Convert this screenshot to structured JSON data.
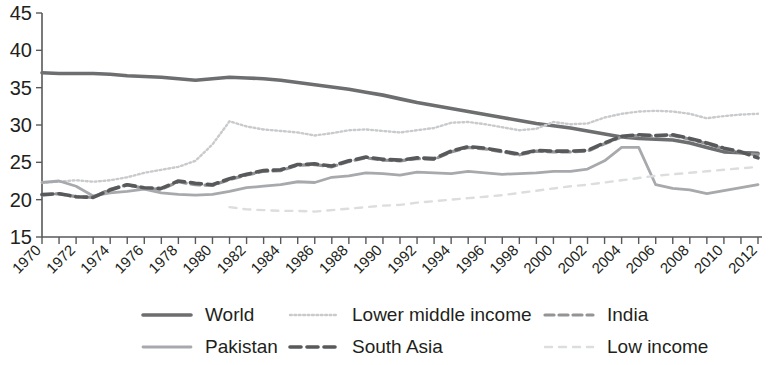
{
  "chart_data": {
    "type": "line",
    "title": "",
    "xlabel": "",
    "ylabel": "",
    "ylim": [
      15,
      45
    ],
    "yticks": [
      15,
      20,
      25,
      30,
      35,
      40,
      45
    ],
    "xlim": [
      1970,
      2012
    ],
    "grid": false,
    "legend_position": "bottom",
    "x": [
      1970,
      1971,
      1972,
      1973,
      1974,
      1975,
      1976,
      1977,
      1978,
      1979,
      1980,
      1981,
      1982,
      1983,
      1984,
      1985,
      1986,
      1987,
      1988,
      1989,
      1990,
      1991,
      1992,
      1993,
      1994,
      1995,
      1996,
      1997,
      1998,
      1999,
      2000,
      2001,
      2002,
      2003,
      2004,
      2005,
      2006,
      2007,
      2008,
      2009,
      2010,
      2011,
      2012
    ],
    "xtick_labels": [
      "1970",
      "1972",
      "1974",
      "1976",
      "1978",
      "1980",
      "1982",
      "1984",
      "1986",
      "1988",
      "1990",
      "1992",
      "1994",
      "1996",
      "1998",
      "2000",
      "2002",
      "2004",
      "2006",
      "2008",
      "2010",
      "2012"
    ],
    "series": [
      {
        "name": "World",
        "color": "#6d6e70",
        "style": "solid",
        "width": 3.6,
        "values": [
          37.0,
          36.9,
          36.9,
          36.9,
          36.8,
          36.6,
          36.5,
          36.4,
          36.2,
          36.0,
          36.2,
          36.4,
          36.3,
          36.2,
          36.0,
          35.7,
          35.4,
          35.1,
          34.8,
          34.4,
          34.0,
          33.5,
          33.0,
          32.6,
          32.2,
          31.8,
          31.4,
          31.0,
          30.6,
          30.2,
          29.9,
          29.6,
          29.2,
          28.8,
          28.4,
          28.2,
          28.1,
          28.0,
          27.6,
          27.0,
          26.4,
          26.3,
          26.2
        ]
      },
      {
        "name": "Lower middle income",
        "color": "#c9cacc",
        "style": "dotted",
        "width": 2.4,
        "values": [
          22.3,
          22.4,
          22.6,
          22.4,
          22.6,
          23.0,
          23.6,
          24.0,
          24.4,
          25.2,
          27.4,
          30.5,
          29.8,
          29.4,
          29.2,
          29.0,
          28.6,
          28.9,
          29.3,
          29.4,
          29.2,
          29.0,
          29.3,
          29.6,
          30.3,
          30.4,
          30.1,
          29.7,
          29.3,
          29.5,
          30.4,
          30.1,
          30.2,
          31.0,
          31.5,
          31.8,
          31.9,
          31.8,
          31.5,
          30.9,
          31.2,
          31.4,
          31.5
        ]
      },
      {
        "name": "India",
        "color": "#929497",
        "style": "dashed",
        "width": 3.2,
        "values": [
          20.6,
          20.8,
          20.4,
          20.3,
          21.4,
          22.0,
          21.5,
          21.4,
          22.4,
          22.0,
          21.9,
          22.7,
          23.3,
          23.8,
          23.9,
          24.6,
          24.7,
          24.4,
          25.1,
          25.6,
          25.3,
          25.2,
          25.5,
          25.4,
          26.4,
          27.0,
          26.8,
          26.4,
          26.0,
          26.5,
          26.4,
          26.4,
          26.5,
          27.5,
          28.4,
          28.6,
          28.5,
          28.6,
          28.1,
          27.5,
          26.8,
          26.3,
          26.0
        ]
      },
      {
        "name": "Pakistan",
        "color": "#a7a9ac",
        "style": "solid",
        "width": 2.8,
        "values": [
          22.3,
          22.5,
          21.8,
          20.5,
          20.9,
          21.1,
          21.4,
          20.9,
          20.7,
          20.6,
          20.7,
          21.1,
          21.6,
          21.8,
          22.0,
          22.4,
          22.3,
          23.0,
          23.2,
          23.6,
          23.5,
          23.3,
          23.7,
          23.6,
          23.5,
          23.8,
          23.6,
          23.4,
          23.5,
          23.6,
          23.8,
          23.8,
          24.1,
          25.2,
          27.0,
          27.0,
          22.0,
          21.5,
          21.3,
          20.8,
          21.2,
          21.6,
          22.0
        ]
      },
      {
        "name": "South Asia",
        "color": "#58595b",
        "style": "dash-bold",
        "width": 3.6,
        "values": [
          20.7,
          20.8,
          20.4,
          20.3,
          21.3,
          22.0,
          21.6,
          21.5,
          22.5,
          22.2,
          22.0,
          22.8,
          23.4,
          23.9,
          24.0,
          24.7,
          24.8,
          24.5,
          25.2,
          25.7,
          25.4,
          25.3,
          25.6,
          25.5,
          26.5,
          27.1,
          26.9,
          26.5,
          26.1,
          26.6,
          26.5,
          26.5,
          26.6,
          27.6,
          28.5,
          28.7,
          28.6,
          28.7,
          28.2,
          27.6,
          26.9,
          26.4,
          25.6
        ]
      },
      {
        "name": "Low income",
        "color": "#dcdddf",
        "style": "dashed-light",
        "width": 2.4,
        "values": [
          null,
          null,
          null,
          null,
          null,
          null,
          null,
          null,
          null,
          null,
          null,
          19.0,
          18.7,
          18.6,
          18.5,
          18.5,
          18.4,
          18.6,
          18.8,
          19.0,
          19.2,
          19.3,
          19.6,
          19.8,
          20.0,
          20.2,
          20.4,
          20.6,
          20.9,
          21.2,
          21.5,
          21.8,
          22.0,
          22.3,
          22.6,
          22.9,
          23.2,
          23.4,
          23.6,
          23.8,
          24.0,
          24.2,
          24.4
        ]
      }
    ]
  },
  "legend": {
    "items": [
      {
        "label": "World",
        "key": "World"
      },
      {
        "label": "Lower middle income",
        "key": "Lower middle income"
      },
      {
        "label": "India",
        "key": "India"
      },
      {
        "label": "Pakistan",
        "key": "Pakistan"
      },
      {
        "label": "South Asia",
        "key": "South Asia"
      },
      {
        "label": "Low income",
        "key": "Low income"
      }
    ]
  }
}
